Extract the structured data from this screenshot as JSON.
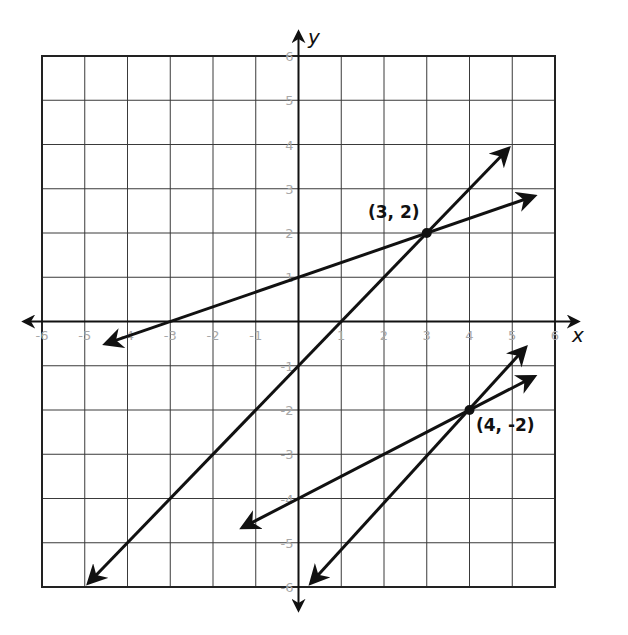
{
  "chart_data": {
    "type": "line",
    "title": "",
    "xlabel": "x",
    "ylabel": "y",
    "xlim": [
      -6,
      6
    ],
    "ylim": [
      -6,
      6
    ],
    "grid": true,
    "x_ticks": [
      -6,
      -5,
      -4,
      -3,
      -2,
      -1,
      1,
      2,
      3,
      4,
      5,
      6
    ],
    "y_ticks": [
      6,
      5,
      4,
      3,
      2,
      1,
      -1,
      -2,
      -3,
      -4,
      -5,
      -6
    ],
    "series": [
      {
        "name": "line-1",
        "equation": "y = x/3 + 1",
        "start": [
          -4.5,
          -0.5
        ],
        "end": [
          5.5,
          2.83
        ]
      },
      {
        "name": "line-2",
        "equation": "y = x - 1",
        "start": [
          -4.9,
          -5.9
        ],
        "end": [
          4.9,
          3.9
        ]
      },
      {
        "name": "line-3",
        "equation": "y = x/2 - 4",
        "start": [
          -1.3,
          -4.65
        ],
        "end": [
          5.5,
          -1.25
        ]
      },
      {
        "name": "line-4",
        "equation": "y = 4x/3 - 22/3",
        "start": [
          0.3,
          -5.9
        ],
        "end": [
          5.3,
          -0.6
        ]
      }
    ],
    "annotations": [
      {
        "label": "(3, 2)",
        "point": [
          3,
          2
        ]
      },
      {
        "label": "(4, -2)",
        "point": [
          4,
          -2
        ]
      }
    ]
  },
  "labels": {
    "x_axis": "x",
    "y_axis": "y",
    "point_a": "(3, 2)",
    "point_b": "(4, -2)"
  }
}
